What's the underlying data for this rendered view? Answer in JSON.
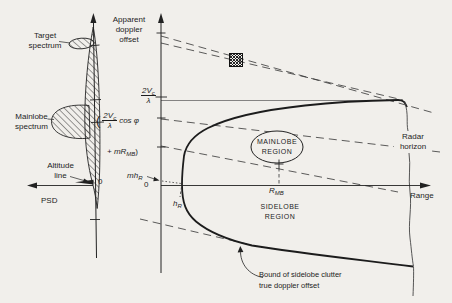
{
  "colors": {
    "background": "#f1efeb",
    "ink": "#1d1d1d"
  },
  "left_plot": {
    "target_spectrum": {
      "line1": "Target",
      "line2": "spectrum"
    },
    "mainlobe_spectrum": {
      "line1": "Mainlobe",
      "line2": "spectrum"
    },
    "altitude_line": {
      "line1": "Altitude",
      "line2": "line"
    },
    "psd_label": "PSD",
    "origin_label": "0",
    "formula": {
      "open_paren": "(",
      "numerator": "2V",
      "numerator_sub": "c",
      "denominator": "λ",
      "cos_term": "cos φ",
      "second_base": "+ mR",
      "second_sub": "MB",
      "close_paren": ")"
    }
  },
  "right_plot": {
    "y_axis_title": {
      "line1": "Apparent",
      "line2": "doppler",
      "line3": "offset"
    },
    "y_tick_fraction": {
      "numerator": "2V",
      "numerator_sub": "c",
      "denominator": "λ"
    },
    "x_axis_label": "Range",
    "origin_label": "0",
    "mh_r": {
      "base": "mh",
      "sub": "R"
    },
    "h_r": {
      "base": "h",
      "sub": "R"
    },
    "r_mb": {
      "base": "R",
      "sub": "MB"
    },
    "mainlobe_region": {
      "line1": "MAINLOBE",
      "line2": "REGION"
    },
    "sidelobe_region": {
      "line1": "SIDELOBE",
      "line2": "REGION"
    },
    "radar_horizon": {
      "line1": "Radar",
      "line2": "horizon"
    },
    "bound_note": {
      "line1": "Bound of sidelobe clutter",
      "line2": "true doppler offset"
    },
    "target_marker": "hatched-square"
  }
}
